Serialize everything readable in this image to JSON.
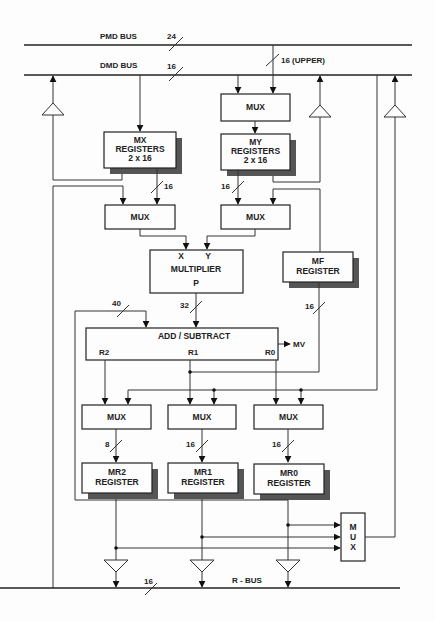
{
  "diagram": {
    "buses": {
      "pmd": {
        "label": "PMD BUS",
        "width": "24"
      },
      "dmd": {
        "label": "DMD BUS",
        "width": "16"
      },
      "upper": {
        "label": "16 (UPPER)"
      },
      "rbus": {
        "label": "R - BUS",
        "width": "16"
      }
    },
    "blocks": {
      "top_mux": {
        "label": "MUX"
      },
      "mx_registers": {
        "line1": "MX",
        "line2": "REGISTERS",
        "line3": "2 x 16"
      },
      "my_registers": {
        "line1": "MY",
        "line2": "REGISTERS",
        "line3": "2 x 16"
      },
      "mux_x": {
        "label": "MUX"
      },
      "mux_y": {
        "label": "MUX"
      },
      "multiplier": {
        "x": "X",
        "y": "Y",
        "label": "MULTIPLIER",
        "p": "P"
      },
      "mf_register": {
        "line1": "MF",
        "line2": "REGISTER"
      },
      "add_subtract": {
        "label": "ADD / SUBTRACT",
        "r2": "R2",
        "r1": "R1",
        "r0": "R0",
        "mv": "MV"
      },
      "mux_r2": {
        "label": "MUX"
      },
      "mux_r1": {
        "label": "MUX"
      },
      "mux_r0": {
        "label": "MUX"
      },
      "mr2_register": {
        "line1": "MR2",
        "line2": "REGISTER"
      },
      "mr1_register": {
        "line1": "MR1",
        "line2": "REGISTER"
      },
      "mr0_register": {
        "line1": "MR0",
        "line2": "REGISTER"
      },
      "out_mux": {
        "l1": "M",
        "l2": "U",
        "l3": "X"
      }
    },
    "widths": {
      "mx_out": "16",
      "my_out": "16",
      "feedback": "40",
      "product": "32",
      "mf_out": "16",
      "mr2_in": "8",
      "mr1_in": "16",
      "mr0_in": "16"
    }
  }
}
